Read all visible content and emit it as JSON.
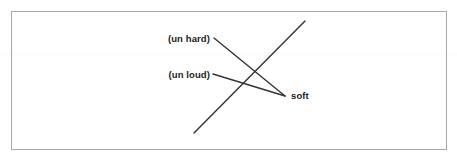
{
  "figure": {
    "background_color": "#ffffff",
    "frame_color": "#a8a8a8",
    "line_color": "#333333",
    "text_color": "#1c1c1c",
    "labels": {
      "un_hard": "(un hard)",
      "un_loud": "(un loud)",
      "soft": "soft"
    }
  },
  "chart_data": {
    "type": "diagram",
    "title": "",
    "nodes": [
      {
        "id": "un_hard",
        "label": "(un hard)",
        "x": 210,
        "y": 39,
        "anchor": "right"
      },
      {
        "id": "un_loud",
        "label": "(un loud)",
        "x": 210,
        "y": 75,
        "anchor": "right"
      },
      {
        "id": "soft",
        "label": "soft",
        "x": 291,
        "y": 96,
        "anchor": "left"
      }
    ],
    "edges": [
      {
        "from": "un_hard",
        "to": "soft",
        "x1": 214,
        "y1": 38,
        "x2": 285,
        "y2": 96
      },
      {
        "from": "un_loud",
        "to": "soft",
        "x1": 213,
        "y1": 74,
        "x2": 285,
        "y2": 96
      }
    ],
    "strokes": [
      {
        "id": "long-diagonal",
        "x1": 194,
        "y1": 133,
        "x2": 305,
        "y2": 21
      }
    ],
    "frame": {
      "x": 11,
      "y": 11,
      "width": 436,
      "height": 139
    }
  }
}
